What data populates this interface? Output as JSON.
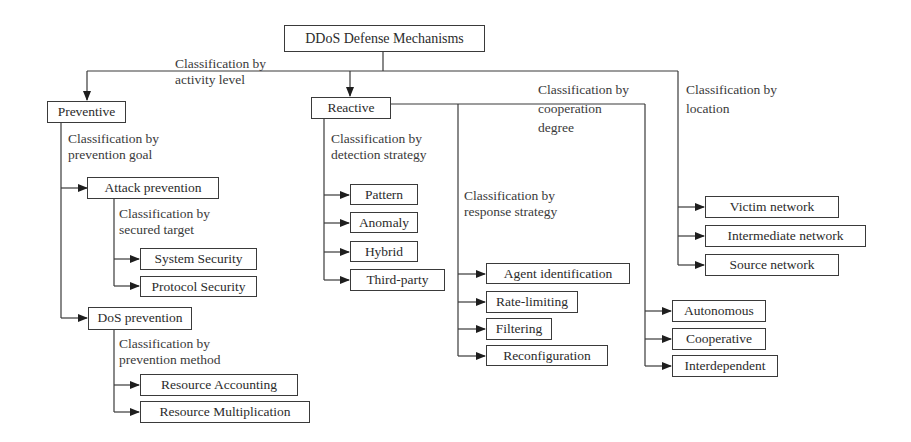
{
  "diagram": {
    "title": "DDoS Defense Mechanisms",
    "root": {
      "label": "DDoS Defense Mechanisms"
    },
    "classifications": {
      "activity_level": {
        "line1": "Classification by",
        "line2": "activity level"
      },
      "prevention_goal": {
        "line1": "Classification by",
        "line2": "prevention goal"
      },
      "secured_target": {
        "line1": "Classification by",
        "line2": "secured target"
      },
      "prevention_method": {
        "line1": "Classification by",
        "line2": "prevention method"
      },
      "detection_strategy": {
        "line1": "Classification by",
        "line2": "detection strategy"
      },
      "response_strategy": {
        "line1": "Classification by",
        "line2": "response strategy"
      },
      "cooperation_degree": {
        "line1": "Classification by",
        "line2": "cooperation",
        "line3": "degree"
      },
      "location": {
        "line1": "Classification by",
        "line2": "location"
      }
    },
    "nodes": {
      "preventive": "Preventive",
      "reactive": "Reactive",
      "attack_prevention": "Attack prevention",
      "system_security": "System Security",
      "protocol_security": "Protocol Security",
      "dos_prevention": "DoS prevention",
      "resource_accounting": "Resource Accounting",
      "resource_multiplication": "Resource Multiplication",
      "pattern": "Pattern",
      "anomaly": "Anomaly",
      "hybrid": "Hybrid",
      "third_party": "Third-party",
      "agent_identification": "Agent identification",
      "rate_limiting": "Rate-limiting",
      "filtering": "Filtering",
      "reconfiguration": "Reconfiguration",
      "autonomous": "Autonomous",
      "cooperative": "Cooperative",
      "interdependent": "Interdependent",
      "victim_network": "Victim network",
      "intermediate_network": "Intermediate network",
      "source_network": "Source network"
    },
    "colors": {
      "line": "#3a3a3a",
      "text": "#2b2b2b",
      "background": "#ffffff"
    }
  }
}
